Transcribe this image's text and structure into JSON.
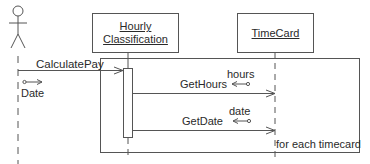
{
  "diagram": {
    "type": "sequence",
    "actor": {
      "name": "actor"
    },
    "objects": [
      {
        "id": "hourly",
        "label_line1": "Hourly",
        "label_line2": "Classification"
      },
      {
        "id": "timecard",
        "label": "TimeCard"
      }
    ],
    "messages": [
      {
        "label": "CalculatePay",
        "from": "actor",
        "to": "hourly",
        "param_out": "Date"
      },
      {
        "label": "GetHours",
        "from": "hourly",
        "to": "timecard",
        "return": "hours"
      },
      {
        "label": "GetDate",
        "from": "hourly",
        "to": "timecard",
        "return": "date"
      }
    ],
    "loop": {
      "guard": "for each timecard"
    },
    "colors": {
      "line": "#555555",
      "text": "#2a2a2a",
      "background": "#ffffff"
    }
  }
}
